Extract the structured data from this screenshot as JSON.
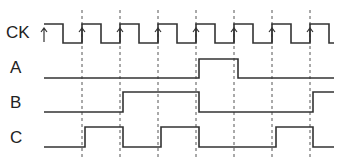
{
  "signals": [
    {
      "name": "CK",
      "label_y": 34
    },
    {
      "name": "A",
      "label_y": 69
    },
    {
      "name": "B",
      "label_y": 104
    },
    {
      "name": "C",
      "label_y": 139
    }
  ],
  "clock": {
    "rising_edges_x": [
      44,
      82,
      120,
      158,
      196,
      234,
      272,
      310
    ],
    "period_px": 38
  },
  "waveforms": {
    "A": "0 0 0 0 1 0 0 0",
    "B": "0 0 1 1 0 0 0 1",
    "C": "0 1 0 1 0 0 1 0"
  }
}
